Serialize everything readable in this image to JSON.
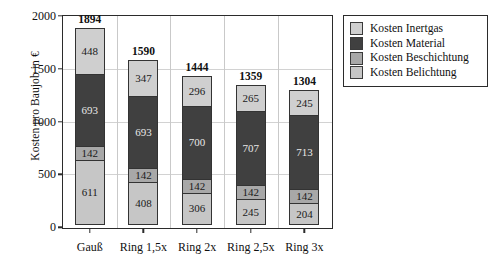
{
  "chart_data": {
    "type": "bar",
    "subtype": "stacked-bar",
    "title": "",
    "xlabel": "",
    "ylabel": "Kosten pro Baujob in €",
    "ylim": [
      0,
      2000
    ],
    "yticks": [
      0,
      500,
      1000,
      1500,
      2000
    ],
    "ytick_labels": [
      "0",
      "500",
      "1000",
      "1500",
      "2000"
    ],
    "grid": true,
    "legend_position": "right-outside",
    "categories": [
      "Gauß",
      "Ring 1,5x",
      "Ring 2x",
      "Ring 2,5x",
      "Ring 3x"
    ],
    "series": [
      {
        "name": "Kosten Belichtung",
        "color": "#c6c6c6",
        "values": [
          611,
          408,
          306,
          245,
          204
        ],
        "labels": [
          "611",
          "408",
          "306",
          "245",
          "204"
        ]
      },
      {
        "name": "Kosten Beschichtung",
        "color": "#a8a8a8",
        "values": [
          142,
          142,
          142,
          142,
          142
        ],
        "labels": [
          "142",
          "142",
          "142",
          "142",
          "142"
        ]
      },
      {
        "name": "Kosten Material",
        "color": "#404040",
        "values": [
          693,
          693,
          700,
          707,
          713
        ],
        "labels": [
          "693",
          "693",
          "700",
          "707",
          "713"
        ]
      },
      {
        "name": "Kosten Inertgas",
        "color": "#cfcfcf",
        "values": [
          448,
          347,
          296,
          265,
          245
        ],
        "labels": [
          "448",
          "347",
          "296",
          "265",
          "245"
        ]
      }
    ],
    "totals": [
      1894,
      1590,
      1444,
      1359,
      1304
    ],
    "total_labels": [
      "1894",
      "1590",
      "1444",
      "1359",
      "1304"
    ]
  },
  "legend": {
    "items": [
      {
        "label": "Kosten Inertgas",
        "color": "#cfcfcf"
      },
      {
        "label": "Kosten Material",
        "color": "#404040"
      },
      {
        "label": "Kosten Beschichtung",
        "color": "#a8a8a8"
      },
      {
        "label": "Kosten Belichtung",
        "color": "#c6c6c6"
      }
    ]
  },
  "colors": {
    "axis": "#2b2b2b",
    "grid": "#d2d2d2",
    "background": "#ffffff",
    "text": "#111111"
  }
}
